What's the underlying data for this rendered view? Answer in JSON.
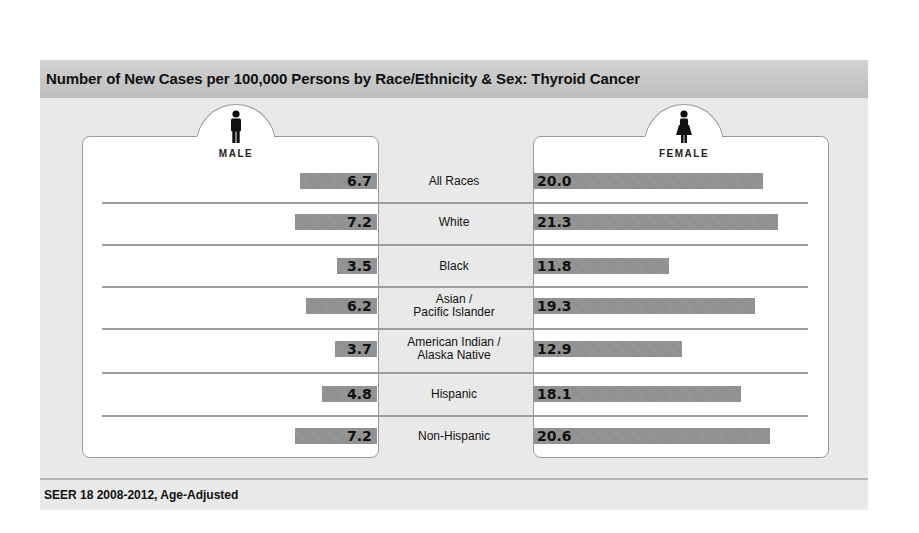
{
  "title": "Number of New Cases per 100,000 Persons by Race/Ethnicity & Sex: Thyroid Cancer",
  "footer": "SEER 18 2008-2012, Age-Adjusted",
  "panels": {
    "male": {
      "label": "MALE",
      "icon": "male-figure-icon"
    },
    "female": {
      "label": "FEMALE",
      "icon": "female-figure-icon"
    }
  },
  "rows": [
    {
      "category": "All Races",
      "male": "6.7",
      "female": "20.0"
    },
    {
      "category": "White",
      "male": "7.2",
      "female": "21.3"
    },
    {
      "category": "Black",
      "male": "3.5",
      "female": "11.8"
    },
    {
      "category": "Asian /\nPacific Islander",
      "male": "6.2",
      "female": "19.3"
    },
    {
      "category": "American Indian /\nAlaska Native",
      "male": "3.7",
      "female": "12.9"
    },
    {
      "category": "Hispanic",
      "male": "4.8",
      "female": "18.1"
    },
    {
      "category": "Non-Hispanic",
      "male": "7.2",
      "female": "20.6"
    }
  ],
  "colors": {
    "bar": "#939393",
    "title_bar": "#c6c6c6",
    "background": "#e9e9e9"
  },
  "chart_data": {
    "type": "bar",
    "orientation": "horizontal-butterfly",
    "title": "Number of New Cases per 100,000 Persons by Race/Ethnicity & Sex: Thyroid Cancer",
    "categories": [
      "All Races",
      "White",
      "Black",
      "Asian / Pacific Islander",
      "American Indian / Alaska Native",
      "Hispanic",
      "Non-Hispanic"
    ],
    "series": [
      {
        "name": "Male",
        "values": [
          6.7,
          7.2,
          3.5,
          6.2,
          3.7,
          4.8,
          7.2
        ]
      },
      {
        "name": "Female",
        "values": [
          20.0,
          21.3,
          11.8,
          19.3,
          12.9,
          18.1,
          20.6
        ]
      }
    ],
    "xlabel": "",
    "ylabel": "",
    "note": "SEER 18 2008-2012, Age-Adjusted",
    "grid": false,
    "legend": "panel headers (MALE left, FEMALE right)"
  }
}
